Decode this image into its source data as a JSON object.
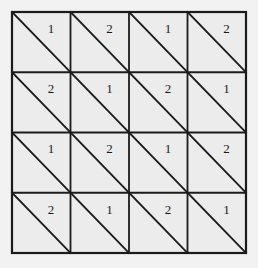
{
  "figure": {
    "name": "triangulated-square-grid",
    "type": "grid-diagram",
    "rows": 4,
    "cols": 4,
    "diagonal_direction": "top-left-to-bottom-right",
    "label_position": "upper-right-triangle",
    "background_color": "#f2f2f2",
    "cell_fill_color": "#ececec",
    "line_color": "#1b1b1b",
    "text_color": "#1b1b1b",
    "geometry": {
      "origin_x": 12,
      "origin_y": 12,
      "cell_width": 58.5,
      "cell_height": 60.25,
      "outer_stroke": 2.2,
      "inner_stroke": 1.8,
      "diagonal_stroke": 1.8
    },
    "grid_values": [
      [
        "1",
        "2",
        "1",
        "2"
      ],
      [
        "2",
        "1",
        "2",
        "1"
      ],
      [
        "1",
        "2",
        "1",
        "2"
      ],
      [
        "2",
        "1",
        "2",
        "1"
      ]
    ]
  }
}
